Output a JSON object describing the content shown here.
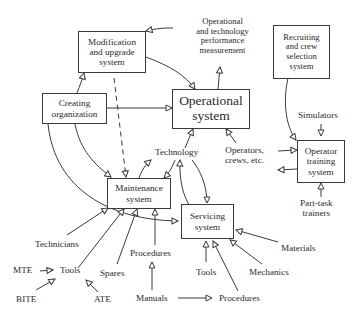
{
  "boxes": {
    "modification": "Modification\nand upgrade\nsystem",
    "operational": "Operational\nsystem",
    "creating": "Creating\norganization",
    "maintenance": "Maintenance\nsystem",
    "servicing": "Servicing\nsystem",
    "recruiting": "Recruiting\nand crew\nselection\nsystem",
    "operator_training": "Operator\ntraining\nsystem"
  },
  "labels": {
    "performance": "Operational\nand technology\nperformance\nmeasurement",
    "technology": "Technology",
    "operators": "Operators,\ncrews, etc.",
    "simulators": "Simulators",
    "part_task": "Part-task\ntrainers",
    "technicians": "Technicians",
    "mte": "MTE",
    "tools_left": "Tools",
    "bite": "BITE",
    "ate": "ATE",
    "spares": "Spares",
    "procedures_mid": "Procedures",
    "manuals": "Manuals",
    "procedures_bottom": "Procedures",
    "tools_right": "Tools",
    "mechanics": "Mechanics",
    "materials": "Materials"
  },
  "style": {
    "line_color": "#3a3a3a"
  }
}
